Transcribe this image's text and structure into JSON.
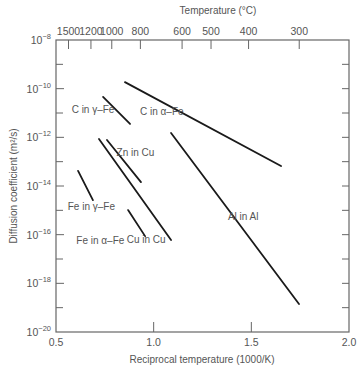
{
  "chart_data": {
    "type": "line",
    "title": "",
    "xlabel": "Reciprocal temperature (1000/K)",
    "ylabel": "Diffusion coefficient (m²/s)",
    "x2label": "Temperature (°C)",
    "xlim": [
      0.5,
      2.0
    ],
    "ylim_log10": [
      -20,
      -8
    ],
    "yscale": "log",
    "grid": false,
    "legend": "inline labels",
    "x_ticks": [
      {
        "value": 0.5,
        "label": "0.5"
      },
      {
        "value": 1.0,
        "label": "1.0"
      },
      {
        "value": 1.5,
        "label": "1.5"
      },
      {
        "value": 2.0,
        "label": "2.0"
      }
    ],
    "y_ticks": [
      {
        "exp": -8,
        "base": "10",
        "sup": "−8"
      },
      {
        "exp": -10,
        "base": "10",
        "sup": "−10"
      },
      {
        "exp": -12,
        "base": "10",
        "sup": "−12"
      },
      {
        "exp": -14,
        "base": "10",
        "sup": "−14"
      },
      {
        "exp": -16,
        "base": "10",
        "sup": "−16"
      },
      {
        "exp": -18,
        "base": "10",
        "sup": "−18"
      },
      {
        "exp": -20,
        "base": "10",
        "sup": "−20"
      }
    ],
    "y_minor_ticks": [
      -9,
      -11,
      -13,
      -15,
      -17,
      -19
    ],
    "top_ticks_celsius": [
      {
        "label": "1500",
        "c": 1500
      },
      {
        "label": "1200",
        "c": 1200
      },
      {
        "label": "1000",
        "c": 1000
      },
      {
        "label": "800",
        "c": 800
      },
      {
        "label": "600",
        "c": 600
      },
      {
        "label": "500",
        "c": 500
      },
      {
        "label": "400",
        "c": 400
      },
      {
        "label": "300",
        "c": 300
      }
    ],
    "series": [
      {
        "name": "C in α–Fe",
        "x": [
          0.853,
          1.652
        ],
        "log10_y": [
          -9.73,
          -13.18
        ],
        "label_at": [
          0.93,
          -11.1
        ]
      },
      {
        "name": "C in γ–Fe",
        "x": [
          0.741,
          0.879
        ],
        "log10_y": [
          -10.34,
          -11.45
        ],
        "label_at": [
          0.58,
          -11.0
        ]
      },
      {
        "name": "Zn in Cu",
        "x": [
          0.761,
          0.935
        ],
        "log10_y": [
          -12.11,
          -13.84
        ],
        "label_at": [
          0.81,
          -12.75
        ]
      },
      {
        "name": "Cu in Cu",
        "x": [
          0.72,
          1.089
        ],
        "log10_y": [
          -12.07,
          -16.22
        ],
        "label_at": [
          0.862,
          -16.35
        ]
      },
      {
        "name": "Al in Al",
        "x": [
          1.089,
          1.744
        ],
        "log10_y": [
          -11.82,
          -18.85
        ],
        "label_at": [
          1.38,
          -15.4
        ]
      },
      {
        "name": "Fe in γ–Fe",
        "x": [
          0.613,
          0.689
        ],
        "log10_y": [
          -13.38,
          -14.58
        ],
        "label_at": [
          0.56,
          -15.0
        ]
      },
      {
        "name": "Fe in α–Fe",
        "x": [
          0.869,
          0.956
        ],
        "log10_y": [
          -14.99,
          -16.06
        ],
        "label_at": [
          0.604,
          -16.4
        ]
      }
    ]
  },
  "style": {
    "line_color": "#1a1a1a",
    "axis_color": "#666666",
    "text_color": "#555555",
    "background": "#ffffff"
  },
  "layout": {
    "plot_left": 56,
    "plot_right": 349,
    "plot_top": 40,
    "plot_bottom": 332
  }
}
